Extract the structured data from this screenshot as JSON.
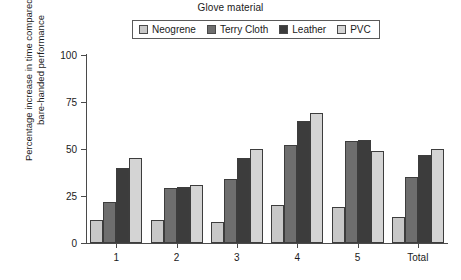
{
  "legend": {
    "title": "Glove material",
    "entries": [
      {
        "label": "Neogrene",
        "color": "#c8c8c8"
      },
      {
        "label": "Terry Cloth",
        "color": "#6e6e6e"
      },
      {
        "label": "Leather",
        "color": "#3c3c3c"
      },
      {
        "label": "PVC",
        "color": "#d4d4d4"
      }
    ]
  },
  "axes": {
    "ylabel": "Percentage increase in time compared with bare-handed performance",
    "xlabel": "",
    "yticks": [
      0,
      25,
      50,
      75,
      100
    ],
    "ytick_labels": [
      "0",
      "25",
      "50",
      "75",
      "100"
    ],
    "xtick_labels": [
      "1",
      "2",
      "3",
      "4",
      "5",
      "Total"
    ]
  },
  "chart_data": {
    "type": "bar",
    "title": "",
    "subtitle": "",
    "legend_title": "Glove material",
    "legend_position": "top",
    "grid": false,
    "xlabel": "",
    "ylabel": "Percentage increase in time compared with bare-handed performance",
    "ylim": [
      0,
      100
    ],
    "ytick_interval": 25,
    "categories": [
      "1",
      "2",
      "3",
      "4",
      "5",
      "Total"
    ],
    "series": [
      {
        "name": "Neogrene",
        "color": "#c8c8c8",
        "values": [
          12,
          12,
          11,
          20,
          19,
          14
        ]
      },
      {
        "name": "Terry Cloth",
        "color": "#6e6e6e",
        "values": [
          22,
          29,
          34,
          52,
          54,
          35
        ]
      },
      {
        "name": "Leather",
        "color": "#3c3c3c",
        "values": [
          40,
          30,
          45,
          65,
          55,
          47
        ]
      },
      {
        "name": "PVC",
        "color": "#d4d4d4",
        "values": [
          45,
          31,
          50,
          69,
          49,
          50
        ]
      }
    ]
  }
}
